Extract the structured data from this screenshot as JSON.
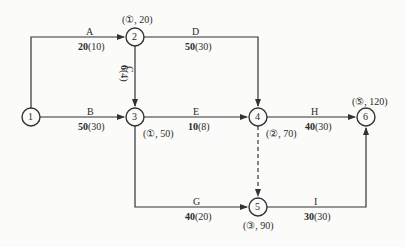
{
  "diagram": {
    "type": "activity-on-arrow network",
    "nodes": [
      {
        "id": "1",
        "label": "1",
        "annotation": ""
      },
      {
        "id": "2",
        "label": "2",
        "annotation": "(①, 20)"
      },
      {
        "id": "3",
        "label": "3",
        "annotation": "(①, 50)"
      },
      {
        "id": "4",
        "label": "4",
        "annotation": "(②, 70)"
      },
      {
        "id": "5",
        "label": "5",
        "annotation": "(③, 90)"
      },
      {
        "id": "6",
        "label": "6",
        "annotation": "(⑤, 120)"
      }
    ],
    "activities": [
      {
        "name": "A",
        "from": "1",
        "to": "2",
        "capacity": "20",
        "flow": "(10)"
      },
      {
        "name": "B",
        "from": "1",
        "to": "3",
        "capacity": "50",
        "flow": "(30)"
      },
      {
        "name": "C",
        "from": "2",
        "to": "3",
        "capacity": "6",
        "flow": "(4)"
      },
      {
        "name": "D",
        "from": "2",
        "to": "4",
        "capacity": "50",
        "flow": "(30)"
      },
      {
        "name": "E",
        "from": "3",
        "to": "4",
        "capacity": "10",
        "flow": "(8)"
      },
      {
        "name": "G",
        "from": "3",
        "to": "5",
        "capacity": "40",
        "flow": "(20)"
      },
      {
        "name": "H",
        "from": "4",
        "to": "6",
        "capacity": "40",
        "flow": "(30)"
      },
      {
        "name": "I",
        "from": "5",
        "to": "6",
        "capacity": "30",
        "flow": "(30)"
      },
      {
        "name": "",
        "from": "4",
        "to": "5",
        "capacity": "",
        "flow": "",
        "dummy": true
      }
    ]
  },
  "colors": {
    "line": "#333333",
    "background": "#fbfbf9"
  }
}
